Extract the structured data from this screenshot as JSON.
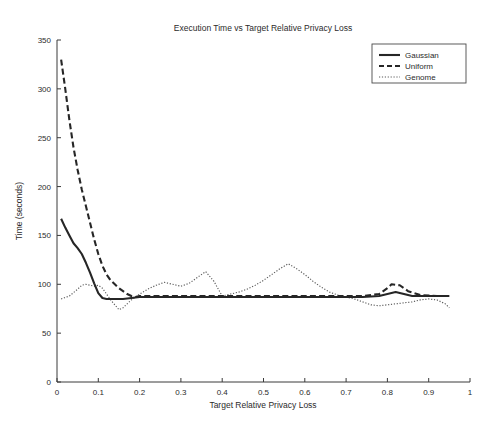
{
  "chart_data": {
    "type": "line",
    "title": "Execution Time vs Target Relative Privacy Loss",
    "xlabel": "Target Relative Privacy Loss",
    "ylabel": "Time (seconds)",
    "xlim": [
      0,
      1
    ],
    "ylim": [
      0,
      350
    ],
    "xticks": [
      0,
      0.1,
      0.2,
      0.3,
      0.4,
      0.5,
      0.6,
      0.7,
      0.8,
      0.9,
      1
    ],
    "xtick_labels": [
      "0",
      "0.1",
      "0.2",
      "0.3",
      "0.4",
      "0.5",
      "0.6",
      "0.7",
      "0.8",
      "0.9",
      "1"
    ],
    "yticks": [
      0,
      50,
      100,
      150,
      200,
      250,
      300,
      350
    ],
    "ytick_labels": [
      "0",
      "50",
      "100",
      "150",
      "200",
      "250",
      "300",
      "350"
    ],
    "grid": false,
    "legend_position": "top-right",
    "legend_entries": [
      "Gaussian",
      "Uniform",
      "Genome"
    ],
    "series": [
      {
        "name": "Gaussian",
        "style": "solid",
        "color": "#262626",
        "x": [
          0.01,
          0.02,
          0.03,
          0.04,
          0.05,
          0.06,
          0.07,
          0.08,
          0.09,
          0.1,
          0.11,
          0.12,
          0.14,
          0.16,
          0.18,
          0.2,
          0.22,
          0.25,
          0.3,
          0.35,
          0.4,
          0.45,
          0.5,
          0.55,
          0.6,
          0.65,
          0.7,
          0.74,
          0.78,
          0.8,
          0.82,
          0.84,
          0.86,
          0.9,
          0.95
        ],
        "y": [
          167,
          158,
          150,
          142,
          137,
          131,
          122,
          112,
          101,
          91,
          86,
          85,
          85,
          85,
          86,
          87,
          87,
          87,
          87,
          87,
          87,
          87,
          87,
          87,
          87,
          87,
          87,
          87,
          88,
          90,
          92,
          90,
          88,
          88,
          88
        ]
      },
      {
        "name": "Uniform",
        "style": "dashed",
        "color": "#262626",
        "x": [
          0.01,
          0.02,
          0.03,
          0.04,
          0.05,
          0.06,
          0.07,
          0.08,
          0.09,
          0.1,
          0.11,
          0.12,
          0.13,
          0.14,
          0.15,
          0.16,
          0.17,
          0.18,
          0.19,
          0.2,
          0.25,
          0.3,
          0.35,
          0.4,
          0.45,
          0.5,
          0.55,
          0.6,
          0.65,
          0.7,
          0.74,
          0.78,
          0.8,
          0.81,
          0.83,
          0.85,
          0.88,
          0.92,
          0.95
        ],
        "y": [
          330,
          300,
          268,
          240,
          217,
          197,
          180,
          163,
          146,
          131,
          119,
          110,
          104,
          100,
          96,
          93,
          90,
          88,
          87,
          88,
          88,
          88,
          88,
          88,
          88,
          88,
          88,
          88,
          88,
          88,
          88,
          90,
          96,
          100,
          99,
          93,
          89,
          88,
          88
        ]
      },
      {
        "name": "Genome",
        "style": "dotted",
        "color": "#5a5a5a",
        "x": [
          0.01,
          0.03,
          0.05,
          0.06,
          0.07,
          0.08,
          0.09,
          0.1,
          0.11,
          0.12,
          0.13,
          0.14,
          0.15,
          0.16,
          0.17,
          0.18,
          0.19,
          0.2,
          0.22,
          0.24,
          0.26,
          0.28,
          0.3,
          0.32,
          0.34,
          0.36,
          0.38,
          0.4,
          0.42,
          0.44,
          0.46,
          0.48,
          0.5,
          0.52,
          0.54,
          0.56,
          0.58,
          0.6,
          0.62,
          0.64,
          0.66,
          0.68,
          0.7,
          0.72,
          0.74,
          0.76,
          0.78,
          0.8,
          0.82,
          0.84,
          0.86,
          0.88,
          0.9,
          0.92,
          0.94,
          0.95
        ],
        "y": [
          85,
          88,
          95,
          99,
          100,
          99,
          98,
          99,
          96,
          90,
          84,
          79,
          74,
          76,
          80,
          84,
          87,
          90,
          95,
          99,
          102,
          100,
          98,
          101,
          107,
          113,
          103,
          88,
          90,
          92,
          95,
          99,
          104,
          110,
          116,
          121,
          116,
          110,
          103,
          97,
          92,
          89,
          87,
          85,
          82,
          79,
          78,
          79,
          80,
          81,
          82,
          84,
          85,
          84,
          80,
          76
        ]
      }
    ]
  },
  "axes": {
    "title": "Execution Time vs Target Relative Privacy Loss",
    "x_title": "Target Relative Privacy Loss",
    "y_title": "Time (seconds)"
  },
  "legend": {
    "items": [
      {
        "label": "Gaussian",
        "style": "solid"
      },
      {
        "label": "Uniform",
        "style": "dashed"
      },
      {
        "label": "Genome",
        "style": "dotted"
      }
    ]
  },
  "colors": {
    "background": "#ffffff",
    "axis": "#3a3a3a",
    "text": "#2b2b2b",
    "gaussian": "#262626",
    "uniform": "#262626",
    "genome": "#5a5a5a"
  }
}
